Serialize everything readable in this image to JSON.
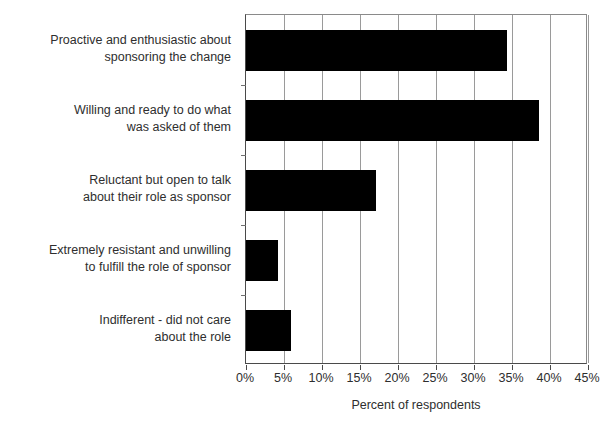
{
  "chart_data": {
    "type": "bar",
    "orientation": "horizontal",
    "title": "",
    "xlabel": "Percent of respondents",
    "ylabel": "",
    "xlim": [
      0,
      45
    ],
    "xtick_labels": [
      "0%",
      "5%",
      "10%",
      "15%",
      "20%",
      "25%",
      "30%",
      "35%",
      "40%",
      "45%"
    ],
    "xtick_values": [
      0,
      5,
      10,
      15,
      20,
      25,
      30,
      35,
      40,
      45
    ],
    "grid": true,
    "legend": "none",
    "bar_color": "#000000",
    "categories": [
      "Proactive and enthusiastic about sponsoring the change",
      "Willing and ready to do what was asked of them",
      "Reluctant but open to talk about their role as sponsor",
      "Extremely resistant and unwilling to fulfill the role of sponsor",
      "Indifferent - did not care about the role"
    ],
    "category_lines": [
      [
        "Proactive and enthusiastic about",
        "sponsoring the change"
      ],
      [
        "Willing and ready to do what",
        "was asked of them"
      ],
      [
        "Reluctant but open to talk",
        "about their role as sponsor"
      ],
      [
        "Extremely resistant and unwilling",
        "to fulfill the role of sponsor"
      ],
      [
        "Indifferent - did not care",
        "about the role"
      ]
    ],
    "values": [
      34.3,
      38.5,
      17.1,
      4.2,
      5.9
    ]
  }
}
